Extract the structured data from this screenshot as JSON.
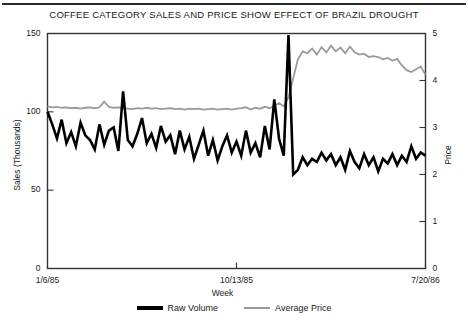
{
  "chart_data": {
    "type": "line",
    "title": "COFFEE CATEGORY SALES AND PRICE SHOW EFFECT OF BRAZIL DROUGHT",
    "xlabel": "Week",
    "ylabel": "Sales (Thousands)",
    "y2label": "Price",
    "grid": false,
    "legend_position": "bottom-center",
    "ylim": [
      0,
      150
    ],
    "y2lim": [
      0,
      5
    ],
    "yticks": [
      "0",
      "50",
      "100",
      "150"
    ],
    "ytick_values": [
      0,
      50,
      100,
      150
    ],
    "y2ticks": [
      "0",
      "1",
      "2",
      "3",
      "4",
      "5"
    ],
    "y2tick_values": [
      0,
      1,
      2,
      3,
      4,
      5
    ],
    "xticks": [
      "1/6/85",
      "10/13/85",
      "7/20/86"
    ],
    "xtick_indices": [
      0,
      40,
      80
    ],
    "series": [
      {
        "name": "Raw Volume",
        "axis": "left",
        "color": "#000000",
        "width": 2.6,
        "values": [
          100,
          92,
          83,
          95,
          80,
          87,
          78,
          93,
          85,
          82,
          76,
          92,
          79,
          88,
          90,
          75,
          113,
          82,
          78,
          86,
          96,
          80,
          86,
          77,
          91,
          81,
          85,
          73,
          88,
          76,
          84,
          70,
          79,
          88,
          72,
          82,
          69,
          78,
          85,
          74,
          81,
          72,
          88,
          74,
          80,
          71,
          91,
          76,
          108,
          83,
          72,
          149,
          60,
          63,
          71,
          66,
          70,
          68,
          74,
          69,
          73,
          66,
          71,
          63,
          75,
          68,
          64,
          73,
          66,
          71,
          62,
          70,
          67,
          73,
          66,
          72,
          68,
          78,
          70,
          74,
          72
        ]
      },
      {
        "name": "Average Price",
        "axis": "right",
        "color": "#9a9a9a",
        "width": 1.8,
        "values": [
          3.45,
          3.43,
          3.44,
          3.42,
          3.43,
          3.41,
          3.42,
          3.4,
          3.42,
          3.43,
          3.41,
          3.43,
          3.55,
          3.44,
          3.42,
          3.43,
          3.41,
          3.4,
          3.39,
          3.41,
          3.4,
          3.42,
          3.4,
          3.41,
          3.39,
          3.4,
          3.41,
          3.39,
          3.4,
          3.38,
          3.4,
          3.39,
          3.4,
          3.38,
          3.39,
          3.4,
          3.38,
          3.39,
          3.4,
          3.38,
          3.4,
          3.41,
          3.43,
          3.38,
          3.42,
          3.4,
          3.44,
          3.41,
          3.46,
          3.52,
          3.45,
          3.64,
          4.05,
          4.45,
          4.62,
          4.58,
          4.68,
          4.55,
          4.71,
          4.6,
          4.74,
          4.62,
          4.7,
          4.58,
          4.72,
          4.6,
          4.55,
          4.57,
          4.5,
          4.52,
          4.5,
          4.45,
          4.48,
          4.42,
          4.46,
          4.32,
          4.22,
          4.18,
          4.24,
          4.3,
          4.12
        ]
      }
    ]
  },
  "legend": {
    "items": [
      {
        "label": "Raw Volume"
      },
      {
        "label": "Average Price"
      }
    ]
  }
}
